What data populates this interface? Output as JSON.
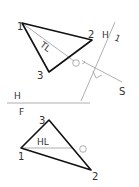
{
  "diagram": {
    "type": "descriptive-geometry-projection",
    "colors": {
      "edge": "#111111",
      "construction": "#9a9a9a",
      "text": "#333333"
    },
    "top_view": {
      "points": {
        "1": {
          "label": "1",
          "x": 22,
          "y": 23
        },
        "2": {
          "label": "2",
          "x": 92,
          "y": 40
        },
        "3": {
          "label": "3",
          "x": 49,
          "y": 72
        }
      },
      "true_length_label": "TL",
      "point_o_label": "O",
      "sight_label": "S",
      "fold_line_label_left": "H",
      "fold_line_label_right": "1"
    },
    "fold_line_hf": {
      "upper_label": "H",
      "lower_label": "F"
    },
    "front_view": {
      "points": {
        "1": {
          "label": "1",
          "x": 21,
          "y": 148
        },
        "2": {
          "label": "2",
          "x": 91,
          "y": 170
        },
        "3": {
          "label": "3",
          "x": 49,
          "y": 120
        }
      },
      "horizontal_line_label": "HL",
      "point_o_label": "O"
    }
  }
}
